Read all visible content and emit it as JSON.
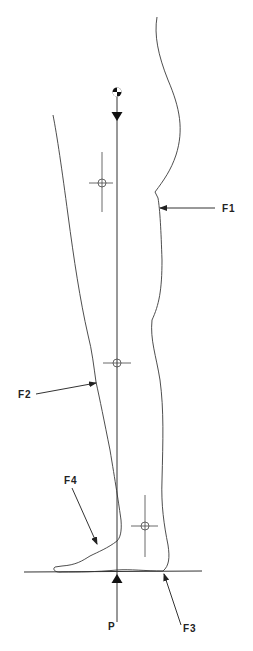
{
  "diagram": {
    "colors": {
      "background": "#ffffff",
      "ink": "#333333"
    },
    "labels": {
      "f1": "F1",
      "f2": "F2",
      "f3": "F3",
      "f4": "F4",
      "p": "P"
    },
    "symbols": {
      "center_of_mass": "center-of-mass-symbol",
      "segment_centers": [
        "thigh-center",
        "shank-center",
        "foot-center"
      ]
    }
  }
}
